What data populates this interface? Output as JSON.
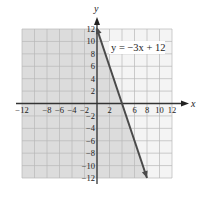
{
  "chart_data": {
    "type": "line",
    "title": "",
    "equation_label": "y = −3x + 12",
    "xlabel": "x",
    "ylabel": "y",
    "xlim": [
      -12,
      12
    ],
    "ylim": [
      -12,
      12
    ],
    "grid": true,
    "grid_step": 2,
    "x_tick_labels": [
      "-12",
      "-8",
      "-6",
      "-4",
      "-2",
      "2",
      "6",
      "8",
      "10",
      "12"
    ],
    "x_tick_values": [
      -12,
      -8,
      -6,
      -4,
      -2,
      2,
      6,
      8,
      10,
      12
    ],
    "y_tick_labels": [
      "12",
      "10",
      "8",
      "6",
      "4",
      "2",
      "-2",
      "-4",
      "-6",
      "-8",
      "-10",
      "-12"
    ],
    "y_tick_values": [
      12,
      10,
      8,
      6,
      4,
      2,
      -2,
      -4,
      -6,
      -8,
      -10,
      -12
    ],
    "series": [
      {
        "name": "y = -3x + 12",
        "slope": -3,
        "intercept": 12,
        "x": [
          0,
          8
        ],
        "y": [
          12,
          -12
        ],
        "arrow_at_end": true
      }
    ],
    "shaded_region": "left of line (y <= -3x + 12)",
    "colors": {
      "line": "#4a4a4a",
      "shade": "#dcdcdc",
      "grid": "#b8b8b8",
      "axis": "#333333"
    }
  }
}
